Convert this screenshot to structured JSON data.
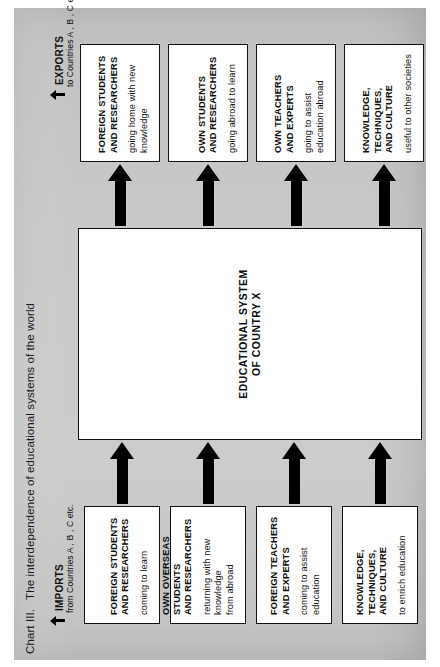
{
  "chart": {
    "number": "Chart III.",
    "title": "The interdependence of educational systems of the world",
    "background_color": "#c9c9c9",
    "box_fill_color": "#ffffff",
    "ink_color": "#111111"
  },
  "flows": {
    "imports": {
      "label": "IMPORTS",
      "sublabel": "from Countries  A ,  B ,  C  etc.",
      "arrow_icon": "arrow-up-icon"
    },
    "exports": {
      "label": "EXPORTS",
      "sublabel": "to Countries  A ,  B ,  C  etc.",
      "arrow_icon": "arrow-up-icon"
    }
  },
  "center": {
    "label": "EDUCATIONAL SYSTEM\nOF COUNTRY  X"
  },
  "inputs": [
    {
      "title": "FOREIGN STUDENTS\nAND RESEARCHERS",
      "sub": "coming to learn"
    },
    {
      "title": "OWN OVERSEAS STUDENTS\nAND RESEARCHERS",
      "sub": "returning with new knowledge\nfrom abroad"
    },
    {
      "title": "FOREIGN TEACHERS\nAND EXPERTS",
      "sub": "coming to assist education"
    },
    {
      "title": "KNOWLEDGE, TECHNIQUES,\nAND CULTURE",
      "sub": "to enrich education"
    }
  ],
  "outputs": [
    {
      "title": "FOREIGN STUDENTS\nAND RESEARCHERS",
      "sub": "going home with new knowledge"
    },
    {
      "title": "OWN STUDENTS\nAND RESEARCHERS",
      "sub": "going abroad to learn"
    },
    {
      "title": "OWN TEACHERS\nAND EXPERTS",
      "sub": "going to assist education abroad"
    },
    {
      "title": "KNOWLEDGE, TECHNIQUES,\nAND CULTURE",
      "sub": "useful to other societies"
    }
  ]
}
